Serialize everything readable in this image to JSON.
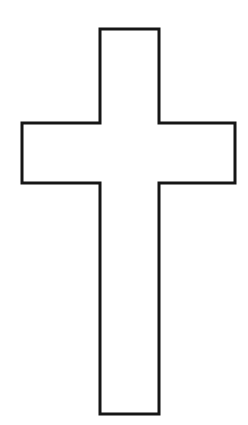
{
  "canvas": {
    "width": 248,
    "height": 425,
    "background": "#ffffff"
  },
  "cross": {
    "description": "Latin cross outline, black stroke on white background",
    "fill": "#ffffff",
    "stroke": "#161616",
    "stroke_width": 3,
    "points": "100,29 159,29 159,123 235,123 235,183 159,183 159,414 100,414 100,183 22,183 22,123 100,123"
  }
}
